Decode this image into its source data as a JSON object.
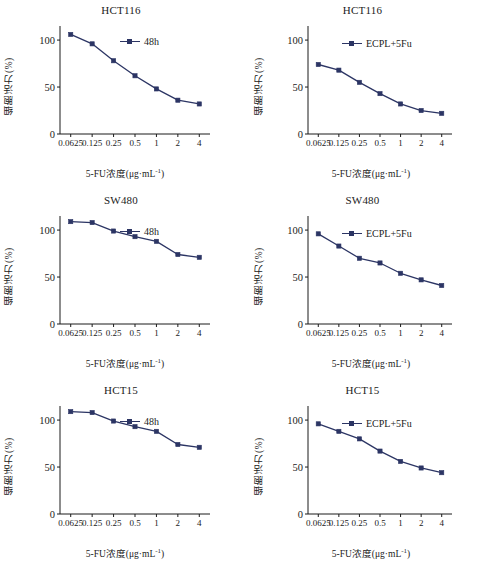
{
  "figure": {
    "panel_count": 6,
    "line_color": "#2c3564",
    "axis_color": "#1b1b1b",
    "background": "#ffffff",
    "caption_fragment": ""
  },
  "axis": {
    "xlabel_main": "5-FU浓度(μg·mL",
    "xlabel_sup": "-1",
    "xlabel_close": ")",
    "ylabel": "细胞活力(%)",
    "xticks": [
      "0.0625",
      "0.125",
      "0.25",
      "0.5",
      "1",
      "2",
      "4"
    ],
    "yticks": [
      "0",
      "50",
      "100"
    ]
  },
  "chart_data": [
    {
      "type": "line",
      "title": "HCT116",
      "xlabel": "5-FU浓度(μg·mL-1)",
      "ylabel": "细胞活力(%)",
      "categories": [
        "0.0625",
        "0.125",
        "0.25",
        "0.5",
        "1",
        "2",
        "4"
      ],
      "series": [
        {
          "name": "48h",
          "values": [
            106,
            96,
            78,
            62,
            48,
            36,
            32
          ]
        }
      ],
      "legend": "48h",
      "legend_position": "top-right",
      "ylim": [
        0,
        115
      ],
      "yticks": [
        0,
        50,
        100
      ],
      "grid": false
    },
    {
      "type": "line",
      "title": "HCT116",
      "xlabel": "5-FU浓度(μg·mL-1)",
      "ylabel": "细胞活力(%)",
      "categories": [
        "0.0625",
        "0.125",
        "0.25",
        "0.5",
        "1",
        "2",
        "4"
      ],
      "series": [
        {
          "name": "ECPL+5Fu",
          "values": [
            74,
            68,
            55,
            43,
            32,
            25,
            22
          ]
        }
      ],
      "legend": "ECPL+5Fu",
      "legend_position": "top-right",
      "ylim": [
        0,
        115
      ],
      "yticks": [
        0,
        50,
        100
      ],
      "grid": false
    },
    {
      "type": "line",
      "title": "SW480",
      "xlabel": "5-FU浓度(μg·mL-1)",
      "ylabel": "细胞活力(%)",
      "categories": [
        "0.0625",
        "0.125",
        "0.25",
        "0.5",
        "1",
        "2",
        "4"
      ],
      "series": [
        {
          "name": "48h",
          "values": [
            109,
            108,
            99,
            93,
            88,
            74,
            71
          ]
        }
      ],
      "legend": "48h",
      "legend_position": "top-right",
      "ylim": [
        0,
        115
      ],
      "yticks": [
        0,
        50,
        100
      ],
      "grid": false
    },
    {
      "type": "line",
      "title": "SW480",
      "xlabel": "5-FU浓度(μg·mL-1)",
      "ylabel": "细胞活力(%)",
      "categories": [
        "0.0625",
        "0.125",
        "0.25",
        "0.5",
        "1",
        "2",
        "4"
      ],
      "series": [
        {
          "name": "ECPL+5Fu",
          "values": [
            96,
            83,
            70,
            65,
            54,
            47,
            41
          ]
        }
      ],
      "legend": "ECPL+5Fu",
      "legend_position": "top-right",
      "ylim": [
        0,
        115
      ],
      "yticks": [
        0,
        50,
        100
      ],
      "grid": false
    },
    {
      "type": "line",
      "title": "HCT15",
      "xlabel": "5-FU浓度(μg·mL-1)",
      "ylabel": "细胞活力(%)",
      "categories": [
        "0.0625",
        "0.125",
        "0.25",
        "0.5",
        "1",
        "2",
        "4"
      ],
      "series": [
        {
          "name": "48h",
          "values": [
            109,
            108,
            99,
            93,
            88,
            74,
            71
          ]
        }
      ],
      "legend": "48h",
      "legend_position": "top-right",
      "ylim": [
        0,
        115
      ],
      "yticks": [
        0,
        50,
        100
      ],
      "grid": false
    },
    {
      "type": "line",
      "title": "HCT15",
      "xlabel": "5-FU浓度(μg·mL-1)",
      "ylabel": "细胞活力(%)",
      "categories": [
        "0.0625",
        "0.125",
        "0.25",
        "0.5",
        "1",
        "2",
        "4"
      ],
      "series": [
        {
          "name": "ECPL+5Fu",
          "values": [
            96,
            88,
            80,
            67,
            56,
            49,
            44
          ]
        }
      ],
      "legend": "ECPL+5Fu",
      "legend_position": "top-right",
      "ylim": [
        0,
        115
      ],
      "yticks": [
        0,
        50,
        100
      ],
      "grid": false
    }
  ]
}
